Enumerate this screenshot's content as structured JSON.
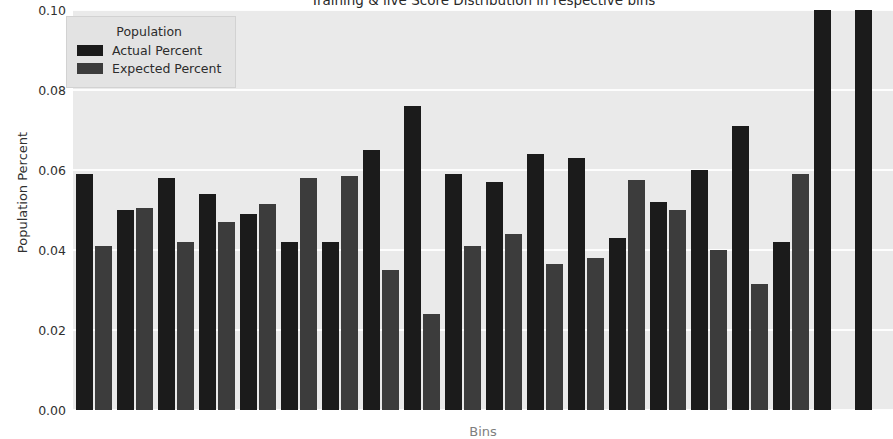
{
  "chart_data": {
    "type": "bar",
    "title": "Training & live Score Distribution in respective bins",
    "xlabel": "Bins",
    "ylabel": "Population Percent",
    "ylim": [
      0.0,
      0.1
    ],
    "yticks": [
      "0.00",
      "0.02",
      "0.04",
      "0.06",
      "0.08",
      "0.10"
    ],
    "ytick_values": [
      0.0,
      0.02,
      0.04,
      0.06,
      0.08,
      0.1
    ],
    "grid": true,
    "grid_axis": "y",
    "legend_title": "Population",
    "legend_position": "upper left",
    "categories": [
      "1",
      "2",
      "3",
      "4",
      "5",
      "6",
      "7",
      "8",
      "9",
      "10",
      "11",
      "12",
      "13",
      "14",
      "15",
      "16",
      "17",
      "18",
      "19",
      "20"
    ],
    "series": [
      {
        "name": "Actual Percent",
        "color": "#1b1b1b",
        "values": [
          0.059,
          0.05,
          0.058,
          0.054,
          0.049,
          0.042,
          0.042,
          0.065,
          0.076,
          0.059,
          0.057,
          0.064,
          0.063,
          0.043,
          0.052,
          0.06,
          0.071,
          0.042,
          0.1,
          0.1
        ]
      },
      {
        "name": "Expected Percent",
        "color": "#3c3c3c",
        "values": [
          0.041,
          0.0505,
          0.042,
          0.047,
          0.0515,
          0.058,
          0.0585,
          0.035,
          0.024,
          0.041,
          0.044,
          0.0365,
          0.038,
          0.0575,
          0.05,
          0.04,
          0.0315,
          0.059,
          null,
          null
        ]
      }
    ]
  },
  "style": {
    "plot_background": "#eaeaea",
    "figure_background": "#ffffff",
    "gridline_color": "#fdfdfd",
    "text_color": "#303030"
  }
}
